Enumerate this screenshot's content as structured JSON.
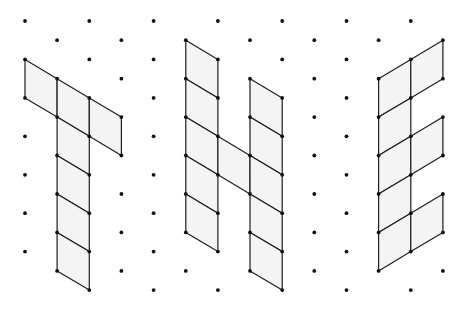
{
  "diagram": {
    "type": "isometric dot grid lettering",
    "grid": {
      "origin_x": 25,
      "origin_y": 21,
      "col_step": 32.15,
      "half_row_step": 19.22,
      "even_cols": [
        0,
        2,
        4,
        6,
        8,
        10,
        12
      ],
      "odd_cols": [
        1,
        3,
        5,
        7,
        9,
        11,
        13
      ],
      "even_v_range": [
        0,
        14
      ],
      "odd_v_range": [
        1,
        13
      ],
      "missing_dots": [
        [
          0,
          14
        ]
      ],
      "dot_radius": 1.9
    },
    "colors": {
      "background": "#ffffff",
      "cell_fill": "#f4f4f4",
      "line": "#1e1e1e",
      "dot": "#111111"
    },
    "letters": [
      {
        "letter": "T",
        "cells": [
          [
            [
              0,
              2
            ],
            [
              1,
              3
            ],
            [
              1,
              5
            ],
            [
              0,
              4
            ]
          ],
          [
            [
              1,
              3
            ],
            [
              2,
              4
            ],
            [
              2,
              6
            ],
            [
              1,
              5
            ]
          ],
          [
            [
              2,
              4
            ],
            [
              3,
              5
            ],
            [
              3,
              7
            ],
            [
              2,
              6
            ]
          ],
          [
            [
              1,
              5
            ],
            [
              2,
              6
            ],
            [
              2,
              8
            ],
            [
              1,
              7
            ]
          ],
          [
            [
              1,
              7
            ],
            [
              2,
              8
            ],
            [
              2,
              10
            ],
            [
              1,
              9
            ]
          ],
          [
            [
              1,
              9
            ],
            [
              2,
              10
            ],
            [
              2,
              12
            ],
            [
              1,
              11
            ]
          ],
          [
            [
              1,
              11
            ],
            [
              2,
              12
            ],
            [
              2,
              14
            ],
            [
              1,
              13
            ]
          ]
        ]
      },
      {
        "letter": "H",
        "cells": [
          [
            [
              5,
              1
            ],
            [
              6,
              2
            ],
            [
              6,
              4
            ],
            [
              5,
              3
            ]
          ],
          [
            [
              5,
              3
            ],
            [
              6,
              4
            ],
            [
              6,
              6
            ],
            [
              5,
              5
            ]
          ],
          [
            [
              5,
              5
            ],
            [
              6,
              6
            ],
            [
              6,
              8
            ],
            [
              5,
              7
            ]
          ],
          [
            [
              5,
              7
            ],
            [
              6,
              8
            ],
            [
              6,
              10
            ],
            [
              5,
              9
            ]
          ],
          [
            [
              5,
              9
            ],
            [
              6,
              10
            ],
            [
              6,
              12
            ],
            [
              5,
              11
            ]
          ],
          [
            [
              6,
              6
            ],
            [
              7,
              7
            ],
            [
              7,
              9
            ],
            [
              6,
              8
            ]
          ],
          [
            [
              7,
              3
            ],
            [
              8,
              4
            ],
            [
              8,
              6
            ],
            [
              7,
              5
            ]
          ],
          [
            [
              7,
              5
            ],
            [
              8,
              6
            ],
            [
              8,
              8
            ],
            [
              7,
              7
            ]
          ],
          [
            [
              7,
              7
            ],
            [
              8,
              8
            ],
            [
              8,
              10
            ],
            [
              7,
              9
            ]
          ],
          [
            [
              7,
              9
            ],
            [
              8,
              10
            ],
            [
              8,
              12
            ],
            [
              7,
              11
            ]
          ],
          [
            [
              7,
              11
            ],
            [
              8,
              12
            ],
            [
              8,
              14
            ],
            [
              7,
              13
            ]
          ]
        ]
      },
      {
        "letter": "E",
        "cells": [
          [
            [
              11,
              3
            ],
            [
              12,
              2
            ],
            [
              12,
              4
            ],
            [
              11,
              5
            ]
          ],
          [
            [
              11,
              5
            ],
            [
              12,
              4
            ],
            [
              12,
              6
            ],
            [
              11,
              7
            ]
          ],
          [
            [
              11,
              7
            ],
            [
              12,
              6
            ],
            [
              12,
              8
            ],
            [
              11,
              9
            ]
          ],
          [
            [
              11,
              9
            ],
            [
              12,
              8
            ],
            [
              12,
              10
            ],
            [
              11,
              11
            ]
          ],
          [
            [
              11,
              11
            ],
            [
              12,
              10
            ],
            [
              12,
              12
            ],
            [
              11,
              13
            ]
          ],
          [
            [
              12,
              2
            ],
            [
              13,
              1
            ],
            [
              13,
              3
            ],
            [
              12,
              4
            ]
          ],
          [
            [
              12,
              6
            ],
            [
              13,
              5
            ],
            [
              13,
              7
            ],
            [
              12,
              8
            ]
          ],
          [
            [
              12,
              10
            ],
            [
              13,
              9
            ],
            [
              13,
              11
            ],
            [
              12,
              12
            ]
          ]
        ]
      }
    ]
  }
}
